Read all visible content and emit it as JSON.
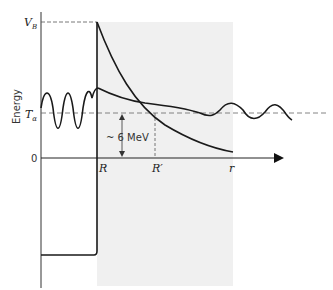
{
  "diagram": {
    "labels": {
      "v_barrier": "V",
      "v_barrier_sub": "B",
      "t_alpha": "T",
      "t_alpha_sub": "α",
      "zero": "0",
      "energy_axis": "Energy",
      "r_nucleus": "R",
      "r_prime": "R′",
      "r_axis": "r",
      "gap_energy": "~ 6 MeV"
    },
    "colors": {
      "stroke": "#1a1a1a",
      "dashed": "#555555",
      "shade": "#f0f0f0",
      "background": "#ffffff"
    }
  }
}
